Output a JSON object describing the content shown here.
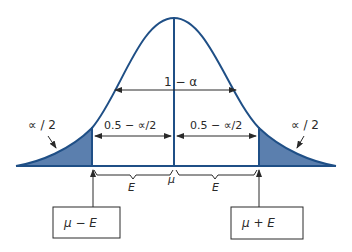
{
  "diagram": {
    "type": "normal-distribution-confidence-interval",
    "colors": {
      "curve": "#1f4f86",
      "tail_fill": "#5b7fae",
      "ink": "#2a2a2a",
      "background": "#ffffff"
    },
    "labels": {
      "center_area": "1 − α",
      "left_tail": "∝ / 2",
      "right_tail": "∝ / 2",
      "left_inner": "0.5 − ∝/2",
      "right_inner": "0.5 − ∝/2",
      "mean": "μ",
      "left_margin": "E",
      "right_margin": "E"
    },
    "boxes": {
      "lower_bound": "μ − E",
      "upper_bound": "μ + E"
    }
  }
}
